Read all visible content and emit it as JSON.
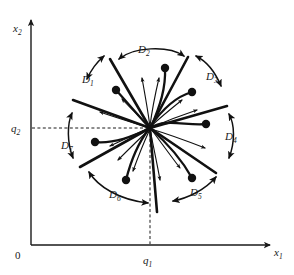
{
  "figure": {
    "type": "phase-portrait-diagram",
    "title": "",
    "background": "#ffffff",
    "ink_color": "#111111",
    "canvas": {
      "width": 294,
      "height": 275
    }
  },
  "axes": {
    "x_axis_label": "x",
    "x_axis_sub": "1",
    "y_axis_label": "x",
    "y_axis_sub": "2",
    "origin_label": "0",
    "x_tick_label": "q",
    "x_tick_sub": "1",
    "y_tick_label": "q",
    "y_tick_sub": "2",
    "x_tick_value": 150,
    "y_tick_value": 128,
    "origin_px": {
      "x": 31,
      "y": 245
    },
    "x_axis_end_px": 272,
    "y_axis_end_px": 18
  },
  "equilibrium": {
    "name": "degenerate-node",
    "center_px": {
      "x": 150,
      "y": 128
    },
    "disk_radius_px": 78,
    "label_q1": "q1",
    "label_q2": "q2"
  },
  "sectors": [
    {
      "id": "D1",
      "label": "D",
      "sub": "1",
      "label_x": 88,
      "label_y": 80,
      "arc_start_deg": 126,
      "arc_end_deg": 158
    },
    {
      "id": "D2",
      "label": "D",
      "sub": "2",
      "label_x": 143,
      "label_y": 50,
      "arc_start_deg": 66,
      "arc_end_deg": 116
    },
    {
      "id": "D3",
      "label": "D",
      "sub": "3",
      "label_x": 211,
      "label_y": 77,
      "arc_start_deg": 22,
      "arc_end_deg": 58
    },
    {
      "id": "D4",
      "label": "D",
      "sub": "4",
      "label_x": 230,
      "label_y": 137,
      "arc_start_deg": -28,
      "arc_end_deg": 12
    },
    {
      "id": "D5",
      "label": "D",
      "sub": "5",
      "label_x": 196,
      "label_y": 193,
      "arc_start_deg": -86,
      "arc_end_deg": -38
    },
    {
      "id": "D6",
      "label": "D",
      "sub": "6",
      "label_x": 115,
      "label_y": 195,
      "arc_start_deg": -150,
      "arc_end_deg": -96
    },
    {
      "id": "D7",
      "label": "D",
      "sub": "7",
      "label_x": 66,
      "label_y": 146,
      "arc_start_deg": 168,
      "arc_end_deg": 202
    }
  ],
  "separatrices": [
    {
      "angle_deg": 120,
      "length": 80
    },
    {
      "angle_deg": 62,
      "length": 80
    },
    {
      "angle_deg": 16,
      "length": 80
    },
    {
      "angle_deg": -34,
      "length": 80
    },
    {
      "angle_deg": -90,
      "length": 88
    },
    {
      "angle_deg": -155,
      "length": 80
    },
    {
      "angle_deg": 163,
      "length": 80
    }
  ],
  "trajectory_dots": [
    {
      "x": 165,
      "y": 68
    },
    {
      "x": 116,
      "y": 90
    },
    {
      "x": 192,
      "y": 92
    },
    {
      "x": 206,
      "y": 124
    },
    {
      "x": 95,
      "y": 142
    },
    {
      "x": 126,
      "y": 180
    },
    {
      "x": 192,
      "y": 178
    }
  ],
  "trajectories": [
    {
      "from_dot": 0,
      "note": "curves into node from upper area"
    },
    {
      "from_dot": 1,
      "note": "curves into node from upper left"
    },
    {
      "from_dot": 2,
      "note": "curves into node from upper right"
    },
    {
      "from_dot": 3,
      "note": "curves into node from right"
    },
    {
      "from_dot": 4,
      "note": "curves into node from left"
    },
    {
      "from_dot": 5,
      "note": "curves into node from lower left"
    },
    {
      "from_dot": 6,
      "note": "curves into node from lower right"
    }
  ],
  "flow_arrow_count": 12,
  "sector_arrow_style": "double-headed curved arc outside disk"
}
